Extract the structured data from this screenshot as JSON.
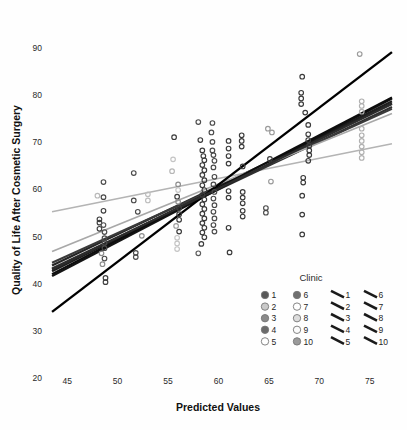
{
  "chart_data": {
    "type": "scatter",
    "title": "",
    "xlabel": "Predicted Values",
    "ylabel": "Quality of Life After Cosmetic Surgery",
    "xlim": [
      43,
      77.5
    ],
    "ylim": [
      20,
      92
    ],
    "xticks": [
      45,
      50,
      55,
      60,
      65,
      70,
      75
    ],
    "yticks": [
      20,
      30,
      40,
      50,
      60,
      70,
      80,
      90
    ],
    "grid": false,
    "legend": {
      "title": "Clinic",
      "position": "inside-bottom-right",
      "marker_entries": [
        {
          "label": "1",
          "color": "#585858"
        },
        {
          "label": "2",
          "color": "#c9c9c9"
        },
        {
          "label": "3",
          "color": "#8a8a8a"
        },
        {
          "label": "4",
          "color": "#6b6b6b"
        },
        {
          "label": "5",
          "color": "#ffffff"
        },
        {
          "label": "6",
          "color": "#6f6f6f"
        },
        {
          "label": "7",
          "color": "#ffffff"
        },
        {
          "label": "8",
          "color": "#dcdcdc"
        },
        {
          "label": "9",
          "color": "#fbfbfb"
        },
        {
          "label": "10",
          "color": "#9a9a9a"
        }
      ],
      "line_entries": [
        {
          "label": "1",
          "color": "#1a1a1a"
        },
        {
          "label": "2",
          "color": "#1a1a1a"
        },
        {
          "label": "3",
          "color": "#1a1a1a"
        },
        {
          "label": "4",
          "color": "#1a1a1a"
        },
        {
          "label": "5",
          "color": "#1a1a1a"
        },
        {
          "label": "6",
          "color": "#1a1a1a"
        },
        {
          "label": "7",
          "color": "#1a1a1a"
        },
        {
          "label": "8",
          "color": "#1a1a1a"
        },
        {
          "label": "9",
          "color": "#1a1a1a"
        },
        {
          "label": "10",
          "color": "#1a1a1a"
        }
      ]
    },
    "fit_lines": [
      {
        "clinic": "1",
        "x0": 43.5,
        "y0": 43.8,
        "x1": 77.2,
        "y1": 78.2,
        "color": "#262626",
        "width": 2.2
      },
      {
        "clinic": "2",
        "x0": 43.5,
        "y0": 55.2,
        "x1": 77.2,
        "y1": 69.6,
        "color": "#b4b4b4",
        "width": 1.7
      },
      {
        "clinic": "3",
        "x0": 43.5,
        "y0": 42.6,
        "x1": 77.2,
        "y1": 78.6,
        "color": "#1f1f1f",
        "width": 2.2
      },
      {
        "clinic": "4",
        "x0": 43.5,
        "y0": 43.2,
        "x1": 77.2,
        "y1": 77.4,
        "color": "#303030",
        "width": 2.2
      },
      {
        "clinic": "5",
        "x0": 43.5,
        "y0": 41.6,
        "x1": 77.2,
        "y1": 79.2,
        "color": "#151515",
        "width": 2.4
      },
      {
        "clinic": "6",
        "x0": 43.5,
        "y0": 44.4,
        "x1": 77.2,
        "y1": 77.0,
        "color": "#3a3a3a",
        "width": 2.0
      },
      {
        "clinic": "7",
        "x0": 43.5,
        "y0": 46.8,
        "x1": 77.2,
        "y1": 76.0,
        "color": "#a8a8a8",
        "width": 1.7
      },
      {
        "clinic": "8",
        "x0": 43.5,
        "y0": 34.0,
        "x1": 77.2,
        "y1": 89.0,
        "color": "#000000",
        "width": 2.4
      },
      {
        "clinic": "9",
        "x0": 43.5,
        "y0": 42.0,
        "x1": 77.2,
        "y1": 79.4,
        "color": "#0d0d0d",
        "width": 2.2
      },
      {
        "clinic": "10",
        "x0": 43.5,
        "y0": 43.0,
        "x1": 77.2,
        "y1": 78.0,
        "color": "#2b2b2b",
        "width": 2.2
      }
    ],
    "points": [
      {
        "x": 48.6,
        "y": 61.5,
        "c": "#4a4a4a"
      },
      {
        "x": 48.0,
        "y": 58.6,
        "c": "#b9b9b9"
      },
      {
        "x": 48.6,
        "y": 58.3,
        "c": "#4a4a4a"
      },
      {
        "x": 48.6,
        "y": 55.4,
        "c": "#3f3f3f"
      },
      {
        "x": 48.2,
        "y": 53.6,
        "c": "#3f3f3f"
      },
      {
        "x": 48.2,
        "y": 52.9,
        "c": "#3f3f3f"
      },
      {
        "x": 48.6,
        "y": 52.4,
        "c": "#555555"
      },
      {
        "x": 48.2,
        "y": 51.6,
        "c": "#3f3f3f"
      },
      {
        "x": 48.7,
        "y": 50.9,
        "c": "#4a4a4a"
      },
      {
        "x": 48.7,
        "y": 49.6,
        "c": "#4a4a4a"
      },
      {
        "x": 48.7,
        "y": 48.6,
        "c": "#4a4a4a"
      },
      {
        "x": 48.7,
        "y": 47.5,
        "c": "#4a4a4a"
      },
      {
        "x": 48.4,
        "y": 46.4,
        "c": "#8d8d8d"
      },
      {
        "x": 48.7,
        "y": 45.3,
        "c": "#4a4a4a"
      },
      {
        "x": 48.5,
        "y": 44.1,
        "c": "#8d8d8d"
      },
      {
        "x": 48.8,
        "y": 41.2,
        "c": "#3f3f3f"
      },
      {
        "x": 48.8,
        "y": 40.3,
        "c": "#3f3f3f"
      },
      {
        "x": 51.6,
        "y": 63.4,
        "c": "#4a4a4a"
      },
      {
        "x": 51.6,
        "y": 57.6,
        "c": "#4a4a4a"
      },
      {
        "x": 52.0,
        "y": 55.2,
        "c": "#4a4a4a"
      },
      {
        "x": 53.0,
        "y": 58.9,
        "c": "#bdbdbd"
      },
      {
        "x": 53.0,
        "y": 57.6,
        "c": "#bdbdbd"
      },
      {
        "x": 52.4,
        "y": 50.1,
        "c": "#8d8d8d"
      },
      {
        "x": 51.8,
        "y": 46.5,
        "c": "#4a4a4a"
      },
      {
        "x": 51.8,
        "y": 45.6,
        "c": "#4a4a4a"
      },
      {
        "x": 55.6,
        "y": 71.0,
        "c": "#3a3a3a"
      },
      {
        "x": 55.5,
        "y": 66.3,
        "c": "#c4c4c4"
      },
      {
        "x": 55.4,
        "y": 63.8,
        "c": "#b5b5b5"
      },
      {
        "x": 56.0,
        "y": 61.0,
        "c": "#8d8d8d"
      },
      {
        "x": 56.0,
        "y": 59.8,
        "c": "#c4c4c4"
      },
      {
        "x": 55.9,
        "y": 58.4,
        "c": "#3a3a3a"
      },
      {
        "x": 56.0,
        "y": 57.3,
        "c": "#8d8d8d"
      },
      {
        "x": 56.1,
        "y": 56.0,
        "c": "#3a3a3a"
      },
      {
        "x": 56.1,
        "y": 54.7,
        "c": "#3a3a3a"
      },
      {
        "x": 56.1,
        "y": 53.5,
        "c": "#3a3a3a"
      },
      {
        "x": 55.8,
        "y": 52.2,
        "c": "#9d9d9d"
      },
      {
        "x": 56.1,
        "y": 51.0,
        "c": "#3a3a3a"
      },
      {
        "x": 55.9,
        "y": 49.7,
        "c": "#c4c4c4"
      },
      {
        "x": 55.9,
        "y": 48.5,
        "c": "#c4c4c4"
      },
      {
        "x": 55.9,
        "y": 47.3,
        "c": "#c4c4c4"
      },
      {
        "x": 58.0,
        "y": 74.2,
        "c": "#4a4a4a"
      },
      {
        "x": 58.2,
        "y": 70.4,
        "c": "#3a3a3a"
      },
      {
        "x": 58.4,
        "y": 68.2,
        "c": "#3a3a3a"
      },
      {
        "x": 58.5,
        "y": 67.0,
        "c": "#3a3a3a"
      },
      {
        "x": 58.6,
        "y": 66.1,
        "c": "#3a3a3a"
      },
      {
        "x": 58.4,
        "y": 65.1,
        "c": "#3a3a3a"
      },
      {
        "x": 58.6,
        "y": 64.0,
        "c": "#3a3a3a"
      },
      {
        "x": 58.4,
        "y": 63.0,
        "c": "#3a3a3a"
      },
      {
        "x": 58.6,
        "y": 61.9,
        "c": "#3a3a3a"
      },
      {
        "x": 58.4,
        "y": 60.8,
        "c": "#3a3a3a"
      },
      {
        "x": 58.6,
        "y": 59.8,
        "c": "#3a3a3a"
      },
      {
        "x": 58.4,
        "y": 58.8,
        "c": "#3a3a3a"
      },
      {
        "x": 58.6,
        "y": 57.8,
        "c": "#3a3a3a"
      },
      {
        "x": 58.4,
        "y": 56.8,
        "c": "#3a3a3a"
      },
      {
        "x": 58.6,
        "y": 55.8,
        "c": "#3a3a3a"
      },
      {
        "x": 58.4,
        "y": 54.8,
        "c": "#3a3a3a"
      },
      {
        "x": 58.6,
        "y": 53.8,
        "c": "#3a3a3a"
      },
      {
        "x": 58.4,
        "y": 52.8,
        "c": "#3a3a3a"
      },
      {
        "x": 58.6,
        "y": 51.8,
        "c": "#3a3a3a"
      },
      {
        "x": 58.4,
        "y": 50.8,
        "c": "#3a3a3a"
      },
      {
        "x": 58.6,
        "y": 49.8,
        "c": "#3a3a3a"
      },
      {
        "x": 58.3,
        "y": 48.4,
        "c": "#3a3a3a"
      },
      {
        "x": 58.0,
        "y": 46.4,
        "c": "#5a5a5a"
      },
      {
        "x": 59.4,
        "y": 74.0,
        "c": "#4a4a4a"
      },
      {
        "x": 59.3,
        "y": 72.0,
        "c": "#4a4a4a"
      },
      {
        "x": 59.4,
        "y": 70.0,
        "c": "#4a4a4a"
      },
      {
        "x": 59.4,
        "y": 68.2,
        "c": "#4a4a4a"
      },
      {
        "x": 59.5,
        "y": 67.2,
        "c": "#4a4a4a"
      },
      {
        "x": 59.6,
        "y": 66.0,
        "c": "#4a4a4a"
      },
      {
        "x": 59.5,
        "y": 64.6,
        "c": "#4a4a4a"
      },
      {
        "x": 59.6,
        "y": 62.6,
        "c": "#4a4a4a"
      },
      {
        "x": 59.5,
        "y": 61.0,
        "c": "#4a4a4a"
      },
      {
        "x": 59.6,
        "y": 59.4,
        "c": "#4a4a4a"
      },
      {
        "x": 59.5,
        "y": 58.0,
        "c": "#4a4a4a"
      },
      {
        "x": 59.6,
        "y": 56.6,
        "c": "#4a4a4a"
      },
      {
        "x": 59.5,
        "y": 55.2,
        "c": "#4a4a4a"
      },
      {
        "x": 59.6,
        "y": 53.8,
        "c": "#4a4a4a"
      },
      {
        "x": 59.5,
        "y": 52.4,
        "c": "#4a4a4a"
      },
      {
        "x": 59.6,
        "y": 51.0,
        "c": "#4a4a4a"
      },
      {
        "x": 61.0,
        "y": 70.2,
        "c": "#3a3a3a"
      },
      {
        "x": 61.0,
        "y": 68.6,
        "c": "#3a3a3a"
      },
      {
        "x": 61.0,
        "y": 67.0,
        "c": "#3a3a3a"
      },
      {
        "x": 61.0,
        "y": 65.4,
        "c": "#3a3a3a"
      },
      {
        "x": 61.0,
        "y": 59.6,
        "c": "#3a3a3a"
      },
      {
        "x": 61.0,
        "y": 58.2,
        "c": "#3a3a3a"
      },
      {
        "x": 61.0,
        "y": 51.8,
        "c": "#3a3a3a"
      },
      {
        "x": 61.1,
        "y": 46.6,
        "c": "#3a3a3a"
      },
      {
        "x": 62.3,
        "y": 71.4,
        "c": "#3a3a3a"
      },
      {
        "x": 62.3,
        "y": 70.2,
        "c": "#3a3a3a"
      },
      {
        "x": 62.3,
        "y": 69.0,
        "c": "#3a3a3a"
      },
      {
        "x": 62.4,
        "y": 64.8,
        "c": "#3a3a3a"
      },
      {
        "x": 62.4,
        "y": 59.4,
        "c": "#3a3a3a"
      },
      {
        "x": 62.4,
        "y": 58.2,
        "c": "#3a3a3a"
      },
      {
        "x": 62.4,
        "y": 57.0,
        "c": "#3a3a3a"
      },
      {
        "x": 62.4,
        "y": 55.4,
        "c": "#3a3a3a"
      },
      {
        "x": 62.4,
        "y": 54.2,
        "c": "#3a3a3a"
      },
      {
        "x": 64.9,
        "y": 72.8,
        "c": "#9a9a9a"
      },
      {
        "x": 65.3,
        "y": 72.0,
        "c": "#9a9a9a"
      },
      {
        "x": 65.1,
        "y": 66.4,
        "c": "#3a3a3a"
      },
      {
        "x": 65.2,
        "y": 61.6,
        "c": "#9a9a9a"
      },
      {
        "x": 64.7,
        "y": 56.0,
        "c": "#4a4a4a"
      },
      {
        "x": 64.7,
        "y": 55.0,
        "c": "#4a4a4a"
      },
      {
        "x": 68.3,
        "y": 83.8,
        "c": "#3a3a3a"
      },
      {
        "x": 68.2,
        "y": 80.4,
        "c": "#3a3a3a"
      },
      {
        "x": 68.2,
        "y": 79.2,
        "c": "#3a3a3a"
      },
      {
        "x": 68.2,
        "y": 78.0,
        "c": "#3a3a3a"
      },
      {
        "x": 68.6,
        "y": 76.2,
        "c": "#3a3a3a"
      },
      {
        "x": 68.9,
        "y": 73.6,
        "c": "#3a3a3a"
      },
      {
        "x": 68.9,
        "y": 71.6,
        "c": "#3a3a3a"
      },
      {
        "x": 68.9,
        "y": 70.4,
        "c": "#3a3a3a"
      },
      {
        "x": 69.0,
        "y": 69.2,
        "c": "#3a3a3a"
      },
      {
        "x": 69.0,
        "y": 68.2,
        "c": "#3a3a3a"
      },
      {
        "x": 69.0,
        "y": 67.2,
        "c": "#3a3a3a"
      },
      {
        "x": 68.9,
        "y": 66.0,
        "c": "#3a3a3a"
      },
      {
        "x": 68.4,
        "y": 62.4,
        "c": "#3a3a3a"
      },
      {
        "x": 68.4,
        "y": 61.4,
        "c": "#3a3a3a"
      },
      {
        "x": 68.3,
        "y": 58.6,
        "c": "#3a3a3a"
      },
      {
        "x": 68.3,
        "y": 54.6,
        "c": "#3a3a3a"
      },
      {
        "x": 68.3,
        "y": 50.4,
        "c": "#3a3a3a"
      },
      {
        "x": 74.0,
        "y": 88.6,
        "c": "#9a9a9a"
      },
      {
        "x": 74.2,
        "y": 78.6,
        "c": "#b0b0b0"
      },
      {
        "x": 74.2,
        "y": 77.6,
        "c": "#b0b0b0"
      },
      {
        "x": 74.2,
        "y": 76.4,
        "c": "#b0b0b0"
      },
      {
        "x": 74.2,
        "y": 72.8,
        "c": "#b0b0b0"
      },
      {
        "x": 74.2,
        "y": 71.4,
        "c": "#b0b0b0"
      },
      {
        "x": 74.2,
        "y": 70.2,
        "c": "#b0b0b0"
      },
      {
        "x": 74.2,
        "y": 69.0,
        "c": "#b0b0b0"
      },
      {
        "x": 74.2,
        "y": 67.8,
        "c": "#b0b0b0"
      },
      {
        "x": 74.2,
        "y": 66.6,
        "c": "#b0b0b0"
      }
    ]
  }
}
